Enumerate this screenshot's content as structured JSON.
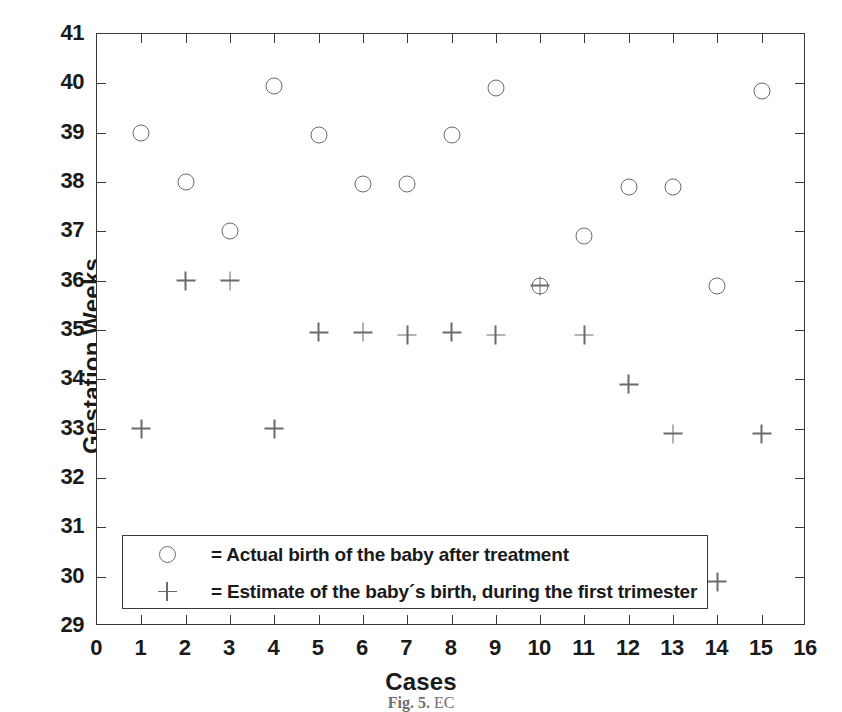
{
  "chart_data": {
    "type": "scatter",
    "title": "",
    "xlabel": "Cases",
    "ylabel": "Gestation Weeks",
    "xlim": [
      0,
      16
    ],
    "ylim": [
      29,
      41
    ],
    "xticks": [
      0,
      1,
      2,
      3,
      4,
      5,
      6,
      7,
      8,
      9,
      10,
      11,
      12,
      13,
      14,
      15,
      16
    ],
    "yticks": [
      29,
      30,
      31,
      32,
      33,
      34,
      35,
      36,
      37,
      38,
      39,
      40,
      41
    ],
    "grid": false,
    "legend_position": "lower-left-inside",
    "x": [
      1,
      2,
      3,
      4,
      5,
      6,
      7,
      8,
      9,
      10,
      11,
      12,
      13,
      14,
      15
    ],
    "series": [
      {
        "name": "Actual birth of the baby after treatment",
        "marker": "circle",
        "values": [
          39.0,
          38.0,
          37.0,
          39.95,
          38.95,
          37.95,
          37.95,
          38.95,
          39.9,
          35.9,
          36.9,
          37.9,
          37.9,
          35.9,
          39.85
        ]
      },
      {
        "name": "Estimate of the baby´s birth, during the first trimester",
        "marker": "plus",
        "values": [
          33.0,
          36.0,
          36.0,
          33.0,
          34.95,
          34.95,
          34.9,
          34.95,
          34.9,
          35.9,
          34.9,
          33.9,
          32.9,
          29.9,
          32.9
        ]
      }
    ]
  },
  "legend": {
    "entries": [
      {
        "symbol": "circle-marker",
        "label": "= Actual birth of the baby after treatment"
      },
      {
        "symbol": "plus-marker",
        "label": "= Estimate of the baby´s birth, during the first trimester"
      }
    ]
  },
  "caption": {
    "figure_number": "Fig. 5.",
    "text": "EC"
  }
}
